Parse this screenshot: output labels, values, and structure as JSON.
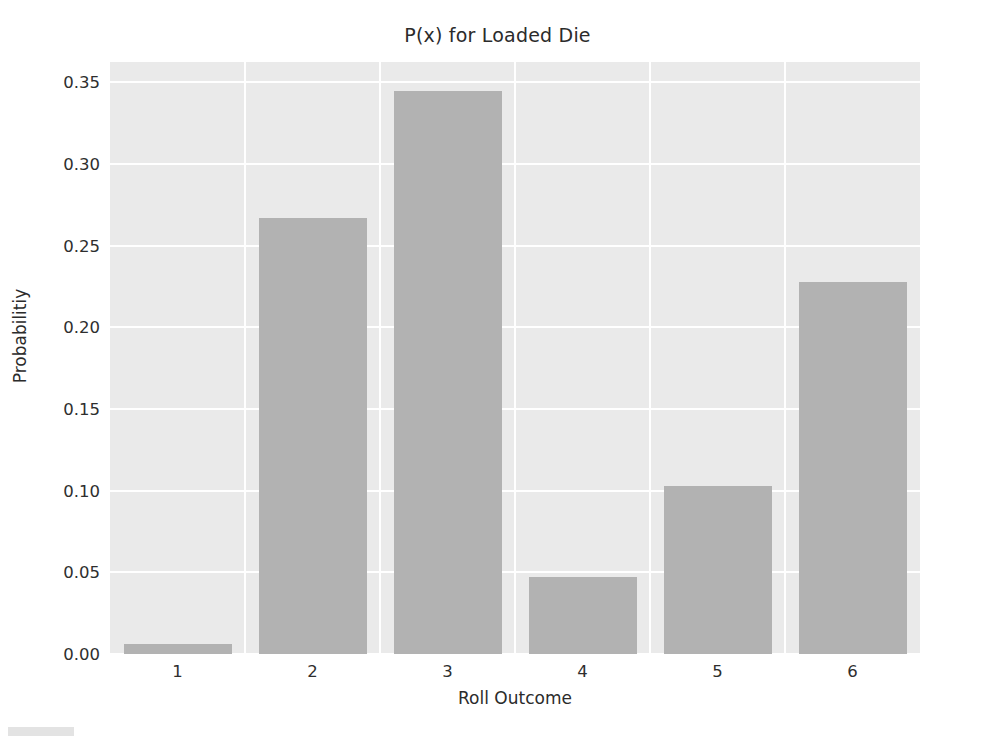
{
  "chart_data": {
    "type": "bar",
    "title": "P(x) for Loaded Die",
    "xlabel": "Roll Outcome",
    "ylabel": "Probabilitiy",
    "categories": [
      "1",
      "2",
      "3",
      "4",
      "5",
      "6"
    ],
    "values": [
      0.006,
      0.267,
      0.345,
      0.047,
      0.103,
      0.228
    ],
    "ylim": [
      0.0,
      0.3625
    ],
    "yticks": [
      0.0,
      0.05,
      0.1,
      0.15,
      0.2,
      0.25,
      0.3,
      0.35
    ],
    "ytick_labels": [
      "0.00",
      "0.05",
      "0.10",
      "0.15",
      "0.20",
      "0.25",
      "0.30",
      "0.35"
    ],
    "grid": true,
    "legend": null,
    "colors": {
      "bar": "#b2b2b2",
      "plot_background": "#eaeaea",
      "gridline": "#ffffff",
      "figure_background": "#ffffff",
      "text": "#2b2b2b"
    },
    "bar_width_fraction": 0.8
  }
}
